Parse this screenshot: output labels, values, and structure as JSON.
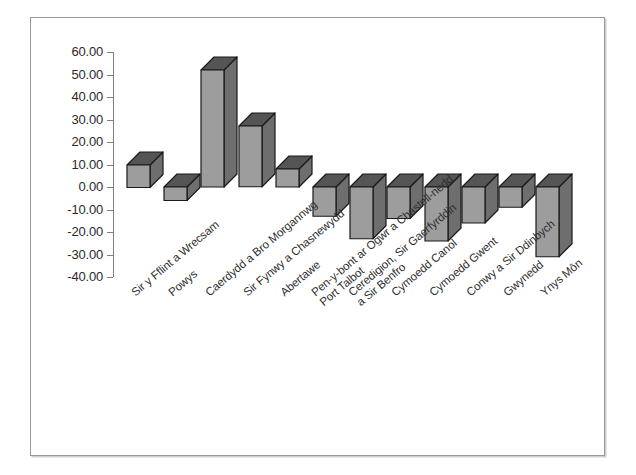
{
  "chart_data": {
    "type": "bar",
    "title": "",
    "subtitle": "",
    "xlabel": "",
    "ylabel": "",
    "ylim": [
      -40,
      60
    ],
    "ytick_step": 10,
    "grid": false,
    "legend": false,
    "three_d": true,
    "bar_color": "#9d9d9d",
    "bar_side_color": "#6e6e6e",
    "bar_top_color": "#555555",
    "bar_outline_color": "#1a1a1a",
    "axis_color": "#808080",
    "frame_color": "#9a9a9a",
    "background": "#ffffff",
    "ytick_labels": [
      "60.00",
      "50.00",
      "40.00",
      "30.00",
      "20.00",
      "10.00",
      "0.00",
      "-10.00",
      "-20.00",
      "-30.00",
      "-40.00"
    ],
    "yticks": [
      60,
      50,
      40,
      30,
      20,
      10,
      0,
      -10,
      -20,
      -30,
      -40
    ],
    "categories": [
      "Sir y Fflint a Wrecsam",
      "Powys",
      "Caerdydd a Bro Morgannwg",
      "Sir Fynwy a Chasnewydd",
      "Abertawe",
      "Pen-y-bont ar Ogwr a Chastell-nedd Port Talbot",
      "Ceredigion, Sir Gaerfyrddin a Sir Benfro",
      "Cymoedd Canol",
      "Cymoedd Gwent",
      "Conwy a Sir Ddinbych",
      "Gwynedd",
      "Ynys Môn"
    ],
    "values": [
      10.0,
      -6.0,
      52.0,
      27.0,
      8.0,
      -13.0,
      -23.0,
      -14.0,
      -24.0,
      -16.0,
      -9.0,
      -31.0
    ]
  }
}
